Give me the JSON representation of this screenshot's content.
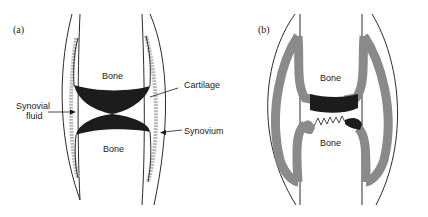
{
  "panels": [
    {
      "id": "a",
      "label": "(a)",
      "title": "Healthy synovial joint",
      "labels": {
        "bone_top": "Bone",
        "bone_bottom": "Bone",
        "cartilage": "Cartilage",
        "synovial_fluid_line1": "Synovial",
        "synovial_fluid_line2": "fluid",
        "synovium": "Synovium"
      }
    },
    {
      "id": "b",
      "label": "(b)",
      "title": "Arthritic joint",
      "labels": {
        "bone_top": "Bone",
        "bone_bottom": "Bone"
      }
    }
  ],
  "colors": {
    "cartilage": "#1c1c1c",
    "synovium_a": "#b8b8b8",
    "synovium_b": "#8a8a8a",
    "outline": "#2a2a2a"
  }
}
